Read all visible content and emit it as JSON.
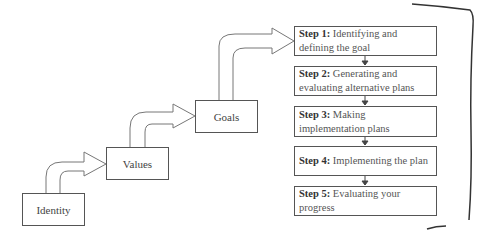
{
  "diagram": {
    "hierarchy": [
      {
        "id": "identity",
        "label": "Identity"
      },
      {
        "id": "values",
        "label": "Values"
      },
      {
        "id": "goals",
        "label": "Goals"
      }
    ],
    "steps": [
      {
        "prefix": "Step 1:",
        "text": " Identifying and defining the goal"
      },
      {
        "prefix": "Step 2:",
        "text": " Generating and evaluating alternative plans"
      },
      {
        "prefix": "Step 3:",
        "text": " Making implementation plans"
      },
      {
        "prefix": "Step 4:",
        "text": " Implementing the plan"
      },
      {
        "prefix": "Step 5:",
        "text": " Evaluating your progress"
      }
    ]
  }
}
